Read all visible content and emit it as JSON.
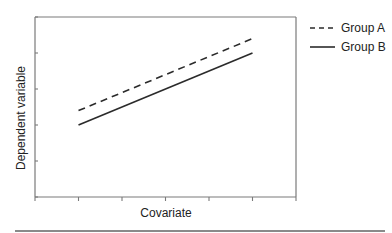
{
  "chart_data": {
    "type": "line",
    "title": "",
    "xlabel": "Covariate",
    "ylabel": "Dependent variable",
    "xlim": [
      0,
      6
    ],
    "ylim": [
      0,
      5
    ],
    "x_ticks": [
      0,
      1,
      2,
      3,
      4,
      5,
      6
    ],
    "y_ticks": [
      0,
      1,
      2,
      3,
      4,
      5
    ],
    "tick_labels_shown": false,
    "grid": false,
    "legend_position": "outside-top-right",
    "series": [
      {
        "name": "Group A",
        "style": "dashed",
        "x": [
          1,
          5
        ],
        "y": [
          2.4,
          4.4
        ]
      },
      {
        "name": "Group B",
        "style": "solid",
        "x": [
          1,
          5
        ],
        "y": [
          2.0,
          4.0
        ]
      }
    ]
  },
  "colors": {
    "series": "#2b2b2b",
    "axis": "#7a7a7a"
  }
}
